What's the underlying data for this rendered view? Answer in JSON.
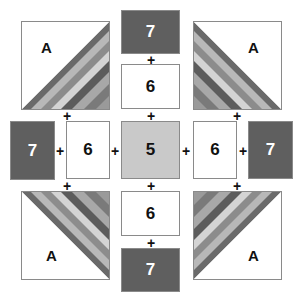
{
  "diagram": {
    "corner_label": "A",
    "pieces": {
      "center": "5",
      "inner": "6",
      "outer": "7"
    },
    "joiner": "+",
    "stripe_colors": [
      "#6a6a6a",
      "#b8b8b8",
      "#8c8c8c",
      "#d4d4d4",
      "#5c5c5c",
      "#a8a8a8",
      "#7a7a7a"
    ],
    "colors": {
      "dark_piece": "#5f5f5f",
      "center_piece": "#c9c9c9",
      "light_piece": "#ffffff",
      "outline": "#8a8a8a"
    }
  }
}
